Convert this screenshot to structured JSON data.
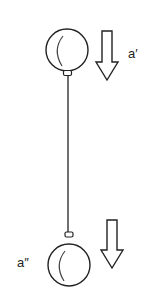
{
  "diagram": {
    "labels": {
      "top": "a′",
      "bottom": "a″"
    },
    "colors": {
      "stroke": "#222222",
      "background": "#ffffff"
    },
    "elements": [
      {
        "type": "ball",
        "name": "top-ball",
        "cx": 67,
        "cy": 50,
        "r": 21
      },
      {
        "type": "ball",
        "name": "bottom-ball",
        "cx": 69,
        "cy": 265,
        "r": 21
      },
      {
        "type": "string",
        "from": [
          68,
          76
        ],
        "to": [
          68,
          232
        ]
      },
      {
        "type": "arrow",
        "direction": "down",
        "name": "top-arrow",
        "label": "a′"
      },
      {
        "type": "arrow",
        "direction": "down",
        "name": "bottom-arrow",
        "label": "a″"
      }
    ]
  }
}
